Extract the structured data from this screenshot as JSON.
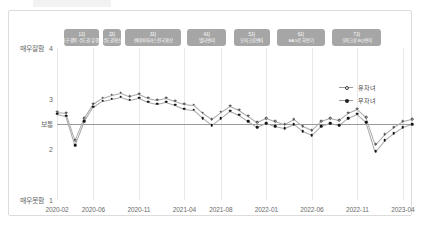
{
  "card": {
    "accent": "#a6a6a6",
    "border": "#dcdcdc"
  },
  "axes": {
    "y": {
      "ticks": [
        {
          "value": 4,
          "num": "4",
          "kr": "매우잘함"
        },
        {
          "value": 3,
          "num": "3",
          "kr": ""
        },
        {
          "value": 2,
          "num": "2",
          "kr": ""
        },
        {
          "value": 1,
          "num": "1",
          "kr": "매우못함"
        }
      ],
      "reference": {
        "value": 2.5,
        "kr": "보통"
      },
      "ylim": [
        1,
        4
      ]
    },
    "x": {
      "ticks": [
        "2020-02",
        "2020-06",
        "2020-11",
        "2021-04",
        "2021-08",
        "2022-01",
        "2022-06",
        "2022-11",
        "2023-04"
      ]
    }
  },
  "bands": [
    {
      "no": "1차",
      "name": "대구·경북·수도권 유행기"
    },
    {
      "no": "2차",
      "name": "수도권확산"
    },
    {
      "no": "3차",
      "name": "변이바이러스 전국확산"
    },
    {
      "no": "4차",
      "name": "델타변이"
    },
    {
      "no": "5차",
      "name": "오미크론변이"
    },
    {
      "no": "6차",
      "name": "BA.5로 하반기"
    },
    {
      "no": "7차",
      "name": "오미크론 BQ변이"
    }
  ],
  "legend": {
    "position": "right-top",
    "entries": [
      {
        "label": "유자녀",
        "marker": "open"
      },
      {
        "label": "무자녀",
        "marker": "solid"
      }
    ]
  },
  "chart_data": {
    "type": "line",
    "title": "",
    "xlabel": "",
    "ylabel": "",
    "ylim": [
      1,
      4
    ],
    "grid": true,
    "x": [
      "2020-02",
      "2020-03",
      "2020-04",
      "2020-05",
      "2020-06",
      "2020-07",
      "2020-08",
      "2020-09",
      "2020-10",
      "2020-11",
      "2020-12",
      "2021-01",
      "2021-02",
      "2021-03",
      "2021-04",
      "2021-05",
      "2021-06",
      "2021-07",
      "2021-08",
      "2021-09",
      "2021-10",
      "2021-11",
      "2021-12",
      "2022-01",
      "2022-02",
      "2022-03",
      "2022-04",
      "2022-05",
      "2022-06",
      "2022-07",
      "2022-08",
      "2022-09",
      "2022-10",
      "2022-11",
      "2022-12",
      "2023-01",
      "2023-02",
      "2023-03",
      "2023-04",
      "2023-05"
    ],
    "series": [
      {
        "name": "유자녀",
        "marker": "open",
        "values": [
          2.74,
          2.72,
          2.18,
          2.62,
          2.9,
          3.02,
          3.08,
          3.12,
          3.05,
          3.1,
          3.02,
          2.98,
          3.02,
          2.96,
          2.9,
          2.88,
          2.72,
          2.6,
          2.74,
          2.86,
          2.78,
          2.66,
          2.54,
          2.62,
          2.56,
          2.5,
          2.6,
          2.46,
          2.38,
          2.56,
          2.62,
          2.58,
          2.72,
          2.8,
          2.64,
          2.1,
          2.3,
          2.44,
          2.56,
          2.6
        ]
      },
      {
        "name": "무자녀",
        "marker": "solid",
        "values": [
          2.7,
          2.66,
          2.08,
          2.55,
          2.84,
          2.96,
          3.0,
          3.04,
          2.98,
          3.02,
          2.94,
          2.9,
          2.94,
          2.88,
          2.8,
          2.78,
          2.62,
          2.48,
          2.62,
          2.76,
          2.68,
          2.56,
          2.44,
          2.52,
          2.46,
          2.42,
          2.5,
          2.36,
          2.28,
          2.46,
          2.52,
          2.48,
          2.62,
          2.7,
          2.54,
          1.96,
          2.18,
          2.32,
          2.44,
          2.5
        ]
      }
    ]
  }
}
